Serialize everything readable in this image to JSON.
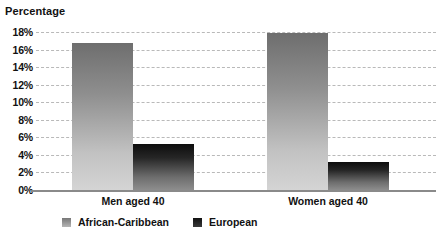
{
  "chart_data": {
    "type": "bar",
    "title": "",
    "ylabel": "Percentage",
    "xlabel": "",
    "categories": [
      "Men aged 40",
      "Women aged 40"
    ],
    "series": [
      {
        "name": "African-Caribbean",
        "values": [
          16.7,
          17.9
        ],
        "color": "#8f8f8f"
      },
      {
        "name": "European",
        "values": [
          5.2,
          3.2
        ],
        "color": "#1a1a1a"
      }
    ],
    "ylim": [
      0,
      18
    ],
    "ytick_step": 2,
    "ytick_labels": [
      "18%",
      "16%",
      "14%",
      "12%",
      "10%",
      "8%",
      "6%",
      "4%",
      "2%",
      "0%"
    ],
    "ytick_values": [
      18,
      16,
      14,
      12,
      10,
      8,
      6,
      4,
      2,
      0
    ],
    "grid": true,
    "grid_style": "dashed-horizontal",
    "legend_position": "bottom-left",
    "bar_style": "vertical-gradient"
  },
  "colors": {
    "background": "#ffffff",
    "grid": "#b9b9b9",
    "axis": "#8a8a8a",
    "text": "#111111",
    "series_african_caribbean": "#8f8f8f",
    "series_european": "#1a1a1a"
  }
}
